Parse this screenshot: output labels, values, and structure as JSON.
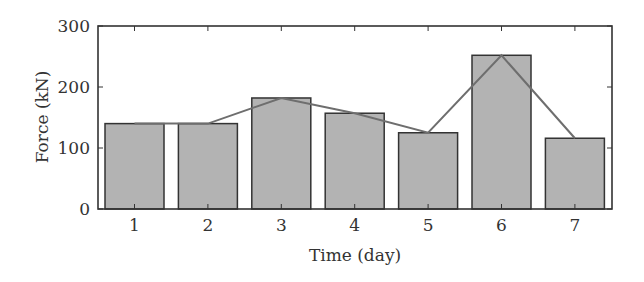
{
  "chart_data": {
    "type": "bar",
    "title": "",
    "xlabel": "Time (day)",
    "ylabel": "Force (kN)",
    "categories": [
      "1",
      "2",
      "3",
      "4",
      "5",
      "6",
      "7"
    ],
    "series": [
      {
        "name": "Force (bars)",
        "type": "bar",
        "values": [
          140,
          140,
          182,
          157,
          125,
          252,
          116
        ]
      },
      {
        "name": "Force (line)",
        "type": "line",
        "values": [
          140,
          140,
          182,
          157,
          125,
          252,
          116
        ]
      }
    ],
    "ylim": [
      0,
      300
    ],
    "yticks": [
      0,
      100,
      200,
      300
    ],
    "ytick_labels": [
      "0",
      "100",
      "200",
      "300"
    ],
    "grid": false,
    "legend": null
  },
  "style": {
    "bar_fill": "#b3b3b3",
    "bar_edge": "#333333",
    "line_color": "#6e6e6e",
    "axis_color": "#333333"
  }
}
